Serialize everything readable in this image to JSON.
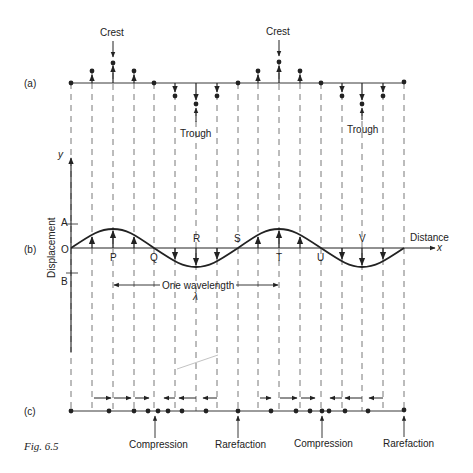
{
  "figure": {
    "caption": "Fig. 6.5",
    "row_labels": {
      "a": "(a)",
      "b": "(b)",
      "c": "(c)"
    }
  },
  "panel_a": {
    "crest_labels": [
      "Crest",
      "Crest"
    ],
    "trough_labels": [
      "Trough",
      "Trough"
    ]
  },
  "panel_b": {
    "y_axis_label": "y",
    "y_axis_title": "Displacement",
    "x_axis_title": "Distance",
    "x_axis_symbol": "x",
    "level_labels": {
      "A": "A",
      "O": "O",
      "B": "B"
    },
    "point_labels": [
      "P",
      "Q",
      "R",
      "S",
      "T",
      "U",
      "V"
    ],
    "wavelength_label": "One wavelength",
    "wavelength_symbol": "λ"
  },
  "panel_c": {
    "labels": [
      "Compression",
      "Rarefaction",
      "Compression",
      "Rarefaction"
    ]
  },
  "colors": {
    "ink": "#222222",
    "dash": "#555555",
    "background": "#ffffff"
  }
}
